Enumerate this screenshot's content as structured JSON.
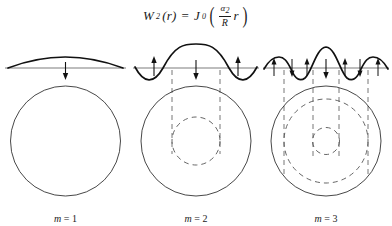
{
  "figure": {
    "formula": {
      "lhs_symbol": "W",
      "lhs_sub": "2",
      "lhs_arg": "(r)",
      "equals": "=",
      "bessel_symbol": "J",
      "bessel_sub": "0",
      "open_paren": "(",
      "numerator": "α",
      "numerator_sub": "2",
      "denominator": "R",
      "multiplier": "r",
      "close_paren": ")",
      "plain_text": "W₂(r) = J₀(α₂/R r)"
    },
    "panels": [
      {
        "id": "panel-m1",
        "label_var": "m",
        "label_eq": "=",
        "label_value": "1",
        "label_text": "m = 1",
        "mode_number": 1,
        "nodal_circles": 0,
        "arrows_down": 1,
        "arrows_up": 0,
        "projection_lines": 0
      },
      {
        "id": "panel-m2",
        "label_var": "m",
        "label_eq": "=",
        "label_value": "2",
        "label_text": "m = 2",
        "mode_number": 2,
        "nodal_circles": 1,
        "arrows_down": 1,
        "arrows_up": 2,
        "projection_lines": 2
      },
      {
        "id": "panel-m3",
        "label_var": "m",
        "label_eq": "=",
        "label_value": "3",
        "label_text": "m = 3",
        "mode_number": 3,
        "nodal_circles": 2,
        "arrows_down": 3,
        "arrows_up": 3,
        "projection_lines": 4
      }
    ],
    "colors": {
      "ink": "#1a1a1a",
      "curve": "#111111",
      "circle": "#333333",
      "dashed": "#555555",
      "background": "#ffffff"
    }
  }
}
